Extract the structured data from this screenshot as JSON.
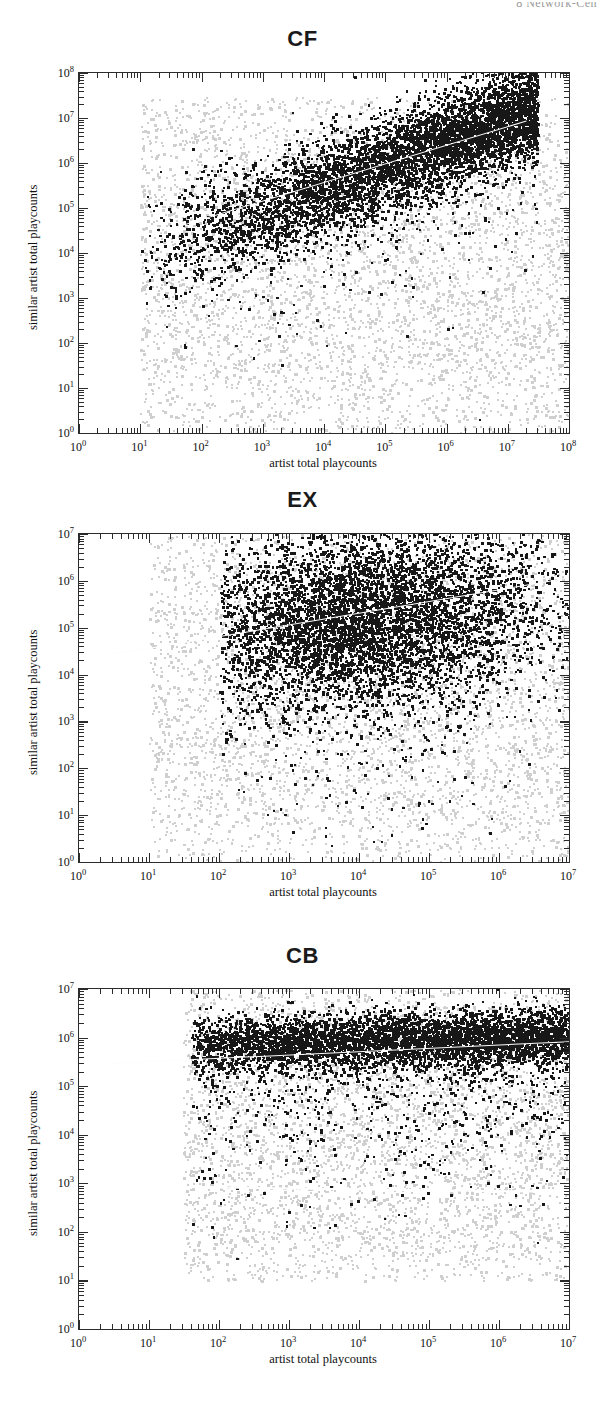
{
  "page": {
    "running_header": "8  Network-Cen"
  },
  "figure": {
    "axis_label_x": "artist total playcounts",
    "axis_label_y": "similar artist total playcounts",
    "panel_titles": [
      "CF",
      "EX",
      "CB"
    ],
    "colors": {
      "foreground_points": "#171717",
      "background_points": "#c9c9c9",
      "fit_line": "#ffffff",
      "axis": "#2b2b2b"
    }
  },
  "chart_data": [
    {
      "type": "scatter",
      "title": "CF",
      "xlabel": "artist total playcounts",
      "ylabel": "similar artist total playcounts",
      "xscale": "log",
      "yscale": "log",
      "xlim": [
        1,
        100000000
      ],
      "ylim": [
        1,
        100000000
      ],
      "xticks": [
        "10^0",
        "10^1",
        "10^2",
        "10^3",
        "10^4",
        "10^5",
        "10^6",
        "10^7",
        "10^8"
      ],
      "yticks": [
        "10^0",
        "10^1",
        "10^2",
        "10^3",
        "10^4",
        "10^5",
        "10^6",
        "10^7",
        "10^8"
      ],
      "grid": false,
      "legend": "none",
      "series": [
        {
          "name": "background artist pairs",
          "color": "#c9c9c9",
          "description": "dense gray cloud spanning x 10^1-10^8, y 10^0-10^7",
          "x_range": [
            10,
            100000000
          ],
          "y_range": [
            1,
            30000000
          ]
        },
        {
          "name": "similar artist pairs",
          "color": "#171717",
          "description": "dark band rising diagonally from (10^1, 10^4) to (10^7, 10^7)",
          "x_range": [
            10,
            30000000
          ],
          "y_range": [
            500,
            20000000
          ]
        }
      ],
      "fit_line": {
        "color": "#ffffff",
        "x_start": 20,
        "y_start": 30000,
        "x_end": 20000000,
        "y_end": 9000000,
        "slope_note": "positive, strong correlation"
      },
      "annotations": []
    },
    {
      "type": "scatter",
      "title": "EX",
      "xlabel": "artist total playcounts",
      "ylabel": "similar artist total playcounts",
      "xscale": "log",
      "yscale": "log",
      "xlim": [
        1,
        30000000
      ],
      "ylim": [
        1,
        30000000
      ],
      "xticks": [
        "10^0",
        "10^1",
        "10^2",
        "10^3",
        "10^4",
        "10^5",
        "10^6",
        "10^7"
      ],
      "yticks": [
        "10^0",
        "10^1",
        "10^2",
        "10^3",
        "10^4",
        "10^5",
        "10^6",
        "10^7"
      ],
      "grid": false,
      "legend": "none",
      "series": [
        {
          "name": "background artist pairs",
          "color": "#c9c9c9",
          "description": "gray cloud spanning x 10^1-10^7, y 10^0-10^7",
          "x_range": [
            10,
            30000000
          ],
          "y_range": [
            1,
            20000000
          ]
        },
        {
          "name": "similar artist pairs",
          "color": "#171717",
          "description": "dark blob centered near (10^4, 10^6), broad vertical spread",
          "x_range": [
            100,
            30000000
          ],
          "y_range": [
            100,
            20000000
          ]
        }
      ],
      "fit_line": {
        "color": "#ffffff",
        "x_start": 3,
        "y_start": 28000,
        "x_end": 25000000,
        "y_end": 1500000,
        "slope_note": "slightly positive, weak correlation"
      },
      "annotations": []
    },
    {
      "type": "scatter",
      "title": "CB",
      "xlabel": "artist total playcounts",
      "ylabel": "similar artist total playcounts",
      "xscale": "log",
      "yscale": "log",
      "xlim": [
        1,
        30000000
      ],
      "ylim": [
        1,
        30000000
      ],
      "xticks": [
        "10^0",
        "10^1",
        "10^2",
        "10^3",
        "10^4",
        "10^5",
        "10^6",
        "10^7"
      ],
      "yticks": [
        "10^0",
        "10^1",
        "10^2",
        "10^3",
        "10^4",
        "10^5",
        "10^6",
        "10^7"
      ],
      "grid": false,
      "legend": "none",
      "series": [
        {
          "name": "background artist pairs",
          "color": "#c9c9c9",
          "description": "gray rectangular cloud spanning x 10^1.5-10^7, y 10^1-10^7",
          "x_range": [
            30,
            25000000
          ],
          "y_range": [
            10,
            20000000
          ]
        },
        {
          "name": "similar artist pairs",
          "color": "#171717",
          "description": "narrow horizontal dark band near y = 10^6, tail of sparse points below",
          "x_range": [
            30,
            25000000
          ],
          "y_range": [
            300,
            10000000
          ]
        }
      ],
      "fit_line": {
        "color": "#ffffff",
        "x_start": 3,
        "y_start": 300000,
        "x_end": 25000000,
        "y_end": 900000,
        "slope_note": "nearly flat"
      },
      "secondary_line": {
        "color": "#ffffff",
        "x_start": 30,
        "y_start": 900,
        "x_end": 25000000,
        "y_end": 700,
        "slope_note": "flat reference line near 10^3"
      },
      "annotations": []
    }
  ]
}
